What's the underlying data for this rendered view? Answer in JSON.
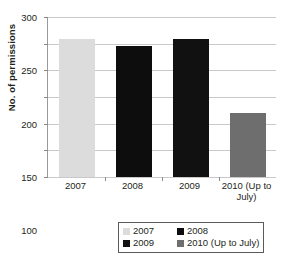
{
  "chart_data": {
    "type": "bar",
    "title": "",
    "xlabel": "",
    "ylabel": "No. of permissions",
    "categories": [
      "2007",
      "2008",
      "2009",
      "2010 (Up to July)"
    ],
    "values": [
      258,
      246,
      258,
      120
    ],
    "ylim": [
      0,
      300
    ],
    "ytick_step": 50,
    "ytick_labels": [
      "300",
      "250",
      "200",
      "150",
      "100",
      "50",
      "0"
    ],
    "ytick_values": [
      300,
      250,
      200,
      150,
      100,
      50,
      0
    ],
    "grid": "horizontal",
    "legend_position": "bottom",
    "series": [
      {
        "name": "2007",
        "value": 258,
        "color": "#dcdcdc"
      },
      {
        "name": "2008",
        "value": 246,
        "color": "#0d0d0d"
      },
      {
        "name": "2009",
        "value": 258,
        "color": "#111111"
      },
      {
        "name": "2010 (Up to July)",
        "value": 120,
        "color": "#6e6e6e"
      }
    ],
    "legend": [
      {
        "label": "2007",
        "color": "#dcdcdc"
      },
      {
        "label": "2008",
        "color": "#0d0d0d"
      },
      {
        "label": "2009",
        "color": "#111111"
      },
      {
        "label": "2010 (Up to July)",
        "color": "#6e6e6e"
      }
    ]
  }
}
